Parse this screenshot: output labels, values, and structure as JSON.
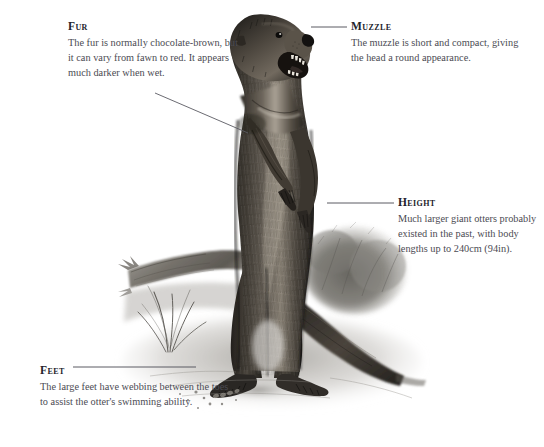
{
  "page": {
    "background_color": "#ffffff",
    "width": 544,
    "height": 447,
    "illustration_style": "graphite-pencil-drawing"
  },
  "illustration": {
    "name": "giant-otter-illustration",
    "alt": "Pencil illustration of a giant otter standing upright on its hind legs on a riverbank, mouth open, with a fallen log, reeds and bushes behind it.",
    "elements": [
      "otter-head",
      "otter-open-mouth",
      "otter-forelimbs",
      "otter-body",
      "otter-tail",
      "otter-hind-feet",
      "fallen-log",
      "reed-grass",
      "background-bush",
      "riverbank-ground"
    ]
  },
  "callouts": [
    {
      "id": "fur",
      "title": "Fur",
      "body": "The fur is normally chocolate-brown, but it can vary from fawn to red. It appears much darker when wet.",
      "leader": {
        "type": "diagonal",
        "x1": 155,
        "y1": 93,
        "x2": 248,
        "y2": 133
      }
    },
    {
      "id": "muzzle",
      "title": "Muzzle",
      "body": "The muzzle is short and compact, giving the head a round appearance.",
      "leader": {
        "type": "horizontal",
        "x1": 311,
        "y1": 27,
        "x2": 347,
        "y2": 27
      }
    },
    {
      "id": "height",
      "title": "Height",
      "body": "Much larger giant otters probably existed in the past, with body lengths up to 240cm (94in).",
      "leader": {
        "type": "horizontal",
        "x1": 327,
        "y1": 203,
        "x2": 394,
        "y2": 203
      }
    },
    {
      "id": "feet",
      "title": "Feet",
      "body": "The large feet have webbing between the toes to assist the otter's swimming ability.",
      "leader": {
        "type": "horizontal",
        "x1": 73,
        "y1": 367,
        "x2": 196,
        "y2": 367
      }
    }
  ],
  "colors": {
    "text_heading": "#23232b",
    "text_body": "#4b4b53",
    "leader_line": "#5a5a62",
    "background": "#ffffff"
  }
}
